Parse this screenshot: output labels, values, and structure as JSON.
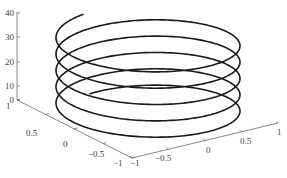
{
  "chart_data": {
    "type": "line3d",
    "title": "",
    "parametric": {
      "t_start": 0,
      "t_end": 31.4159,
      "turns": 5
    },
    "x": {
      "label": "",
      "ticks": [
        -1,
        -0.5,
        0,
        0.5,
        1
      ],
      "tick_labels": [
        "−1",
        "−0.5",
        "0",
        "0.5",
        "1"
      ],
      "range": [
        -1,
        1
      ]
    },
    "y": {
      "label": "",
      "ticks": [
        -1,
        -0.5,
        0,
        0.5,
        1
      ],
      "tick_labels": [
        "−1",
        "−0.5",
        "0",
        "0.5",
        "1"
      ],
      "range": [
        -1,
        1
      ]
    },
    "z": {
      "label": "",
      "ticks": [
        0,
        10,
        20,
        30,
        40
      ],
      "tick_labels": [
        "0",
        "10",
        "20",
        "30",
        "40"
      ],
      "range": [
        0,
        40
      ]
    },
    "grid": false,
    "legend": null,
    "line_color": "#1a1a1a",
    "axis_color": "#555555"
  },
  "projection": {
    "cx": 148,
    "a": 92,
    "b": 30,
    "y_at_first_left_extreme": 103,
    "px_per_rad": 2.6,
    "theta_start": 0.89,
    "theta_end": 32.2
  },
  "axes_geometry": {
    "z_axis": {
      "x": 17,
      "y_top": 12,
      "y_bottom": 100,
      "ticks": [
        {
          "label": "40",
          "y": 13
        },
        {
          "label": "30",
          "y": 37
        },
        {
          "label": "20",
          "y": 62
        },
        {
          "label": "10",
          "y": 86
        },
        {
          "label": "0",
          "y": 100
        }
      ]
    },
    "left_floor_axis": {
      "from": [
        17,
        100
      ],
      "to": [
        132,
        158
      ],
      "ticks": [
        {
          "label": "1",
          "x": 6,
          "y": 109
        },
        {
          "label": "0.5",
          "x": 26,
          "y": 136
        },
        {
          "label": "0",
          "x": 63,
          "y": 147
        },
        {
          "label": "−0.5",
          "x": 88,
          "y": 157
        },
        {
          "label": "−1",
          "x": 113,
          "y": 166
        }
      ]
    },
    "right_floor_axis": {
      "from": [
        132,
        158
      ],
      "to": [
        278,
        123
      ],
      "ticks": [
        {
          "label": "−1",
          "x": 130,
          "y": 166
        },
        {
          "label": "−0.5",
          "x": 155,
          "y": 161
        },
        {
          "label": "0",
          "x": 206,
          "y": 153
        },
        {
          "label": "0.5",
          "x": 240,
          "y": 144
        },
        {
          "label": "1",
          "x": 277,
          "y": 135
        }
      ]
    }
  }
}
